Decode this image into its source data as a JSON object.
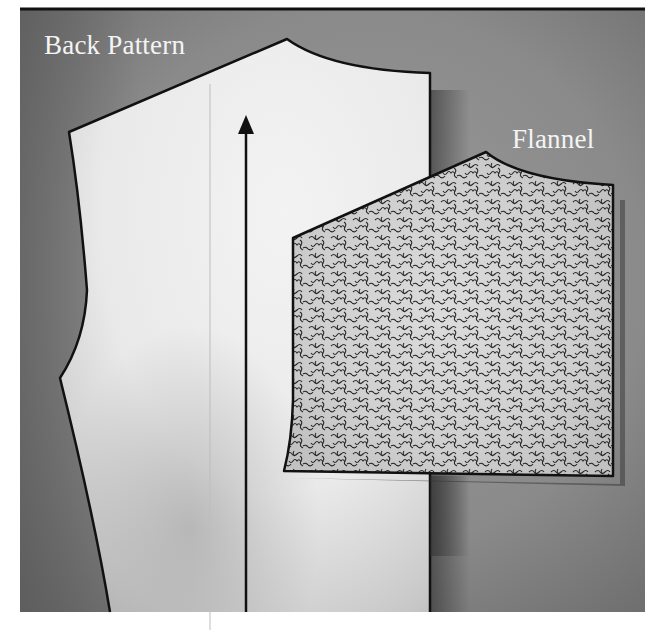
{
  "figure": {
    "labels": {
      "back_pattern": "Back Pattern",
      "flannel": "Flannel"
    },
    "colors": {
      "background_dark": "#5e5e5e",
      "background_mid": "#8e8e8e",
      "pattern_fill": "#ececec",
      "outline": "#111111",
      "label_text": "#f4f4f4",
      "flannel_fill": "#d8d8d8",
      "flannel_squiggle": "#2a2a2a"
    },
    "pieces": [
      {
        "name": "back-pattern-piece",
        "description": "Paper back bodice pattern with grainline arrow"
      },
      {
        "name": "flannel-piece",
        "description": "Textured flannel fabric piece overlapping the pattern"
      }
    ]
  }
}
